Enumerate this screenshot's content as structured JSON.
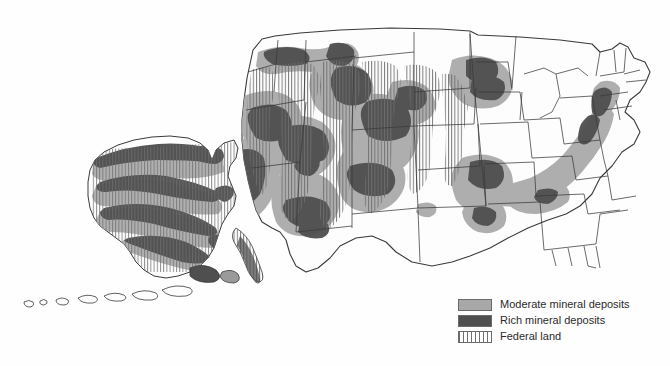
{
  "map": {
    "title": "United States mineral deposits and federal land",
    "regions": [
      "Contiguous United States",
      "Alaska"
    ],
    "colors": {
      "moderate": "#a8a8a8",
      "rich": "#4f4f4f",
      "federal_hatch": "#6e6e6e",
      "land": "#fdfdfd",
      "border": "#3a3a3a",
      "background": "#fefefe"
    }
  },
  "legend": {
    "items": [
      {
        "swatch": "moderate",
        "label": "Moderate mineral deposits"
      },
      {
        "swatch": "rich",
        "label": "Rich mineral deposits"
      },
      {
        "swatch": "federal",
        "label": "Federal land"
      }
    ]
  }
}
